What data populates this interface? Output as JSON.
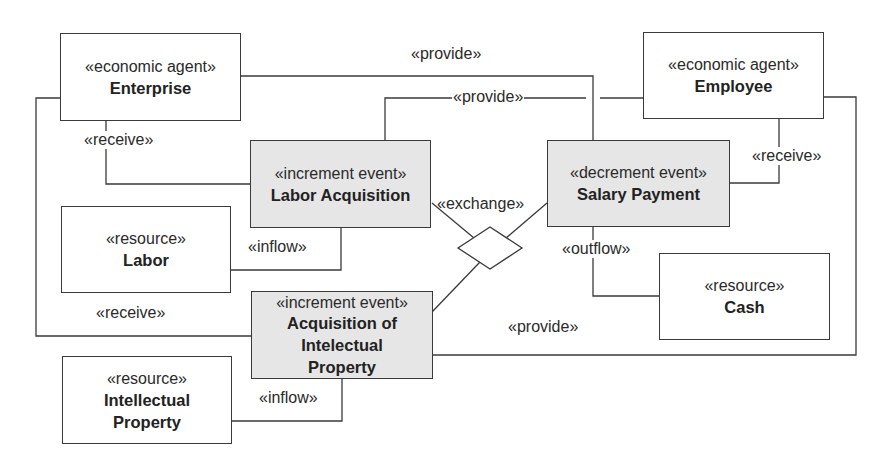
{
  "diagram": {
    "type": "REA model diagram",
    "nodes": {
      "enterprise": {
        "stereotype": "«economic agent»",
        "name": "Enterprise"
      },
      "employee": {
        "stereotype": "«economic agent»",
        "name": "Employee"
      },
      "labor_acquisition": {
        "stereotype": "«increment event»",
        "name": "Labor Acquisition"
      },
      "salary_payment": {
        "stereotype": "«decrement event»",
        "name": "Salary Payment"
      },
      "labor": {
        "stereotype": "«resource»",
        "name": "Labor"
      },
      "cash": {
        "stereotype": "«resource»",
        "name": "Cash"
      },
      "acquisition_ip": {
        "stereotype": "«increment event»",
        "name_lines": [
          "Acquisition of",
          "Intelectual",
          "Property"
        ]
      },
      "intellectual_property": {
        "stereotype": "«resource»",
        "name_lines": [
          "Intellectual",
          "Property"
        ]
      }
    },
    "relations": {
      "provide_top": "«provide»",
      "provide_mid": "«provide»",
      "provide_bottom": "«provide»",
      "receive_enterprise": "«receive»",
      "receive_employee": "«receive»",
      "receive_outer": "«receive»",
      "exchange": "«exchange»",
      "inflow_labor": "«inflow»",
      "inflow_ip": "«inflow»",
      "outflow_cash": "«outflow»"
    },
    "colors": {
      "event_fill": "#e6e6e6",
      "box_fill": "#ffffff",
      "line": "#3a3a3a"
    }
  }
}
